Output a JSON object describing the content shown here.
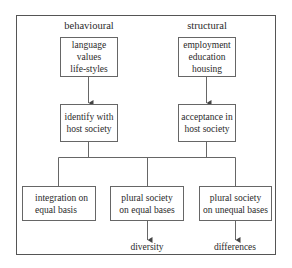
{
  "headings": {
    "left": "behavioural",
    "right": "structural"
  },
  "top_boxes": {
    "left": "language\nvalues\nlife-styles",
    "right": "employment\neducation\nhousing"
  },
  "middle_boxes": {
    "left": "identify with\nhost society",
    "right": "acceptance in\nhost society"
  },
  "bottom_boxes": [
    "integration on\nequal basis",
    "plural society\non equal bases",
    "plural society\non unequal bases"
  ],
  "outcomes": {
    "middle": "diversity",
    "right": "differences"
  },
  "colors": {
    "line": "#555555",
    "text": "#2a2a2a",
    "background": "#ffffff"
  }
}
